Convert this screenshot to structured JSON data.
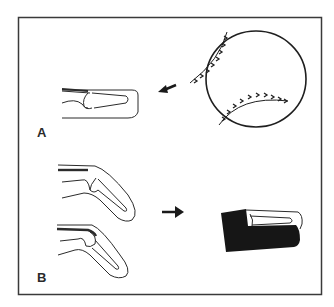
{
  "figure": {
    "panels": [
      {
        "label": "A",
        "description": "Baseball striking the fingertip causing mallet finger injury"
      },
      {
        "label": "B",
        "description": "Tendon rupture / avulsion variants treated with a dorsal splint"
      }
    ],
    "colors": {
      "line": "#2b2b2b",
      "splint": "#1a1a1a",
      "background": "#ffffff",
      "frame": "#3a3a3a"
    }
  }
}
